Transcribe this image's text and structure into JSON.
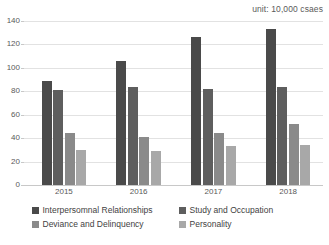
{
  "unit_note": "unit: 10,000 csaes",
  "legend": {
    "items": [
      {
        "label": "Interpersomnal Relationships",
        "color": "#4a4a4a"
      },
      {
        "label": "Study and Occupation",
        "color": "#5e5e5e"
      },
      {
        "label": "Deviance and Delinquency",
        "color": "#8a8a8a"
      },
      {
        "label": "Personality",
        "color": "#a8a8a8"
      }
    ]
  },
  "chart_data": {
    "type": "bar",
    "title": "",
    "subtitle": "",
    "xlabel": "",
    "ylabel": "",
    "annotations": [
      "unit: 10,000 csaes"
    ],
    "categories": [
      "2015",
      "2016",
      "2017",
      "2018"
    ],
    "ylim": [
      0,
      140
    ],
    "yticks": [
      0,
      20,
      40,
      60,
      80,
      100,
      120,
      140
    ],
    "ytick_labels": [
      "0",
      "20",
      "40",
      "60",
      "80",
      "100",
      "120",
      "140"
    ],
    "grid": true,
    "legend_position": "bottom",
    "series": [
      {
        "name": "Interpersomnal Relationships",
        "color": "#4a4a4a",
        "values": [
          89,
          106,
          126,
          133
        ]
      },
      {
        "name": "Study and Occupation",
        "color": "#5e5e5e",
        "values": [
          81,
          84,
          82,
          84
        ]
      },
      {
        "name": "Deviance and Delinquency",
        "color": "#8a8a8a",
        "values": [
          44,
          41,
          44,
          52
        ]
      },
      {
        "name": "Personality",
        "color": "#a8a8a8",
        "values": [
          30,
          29,
          33,
          34
        ]
      }
    ]
  }
}
